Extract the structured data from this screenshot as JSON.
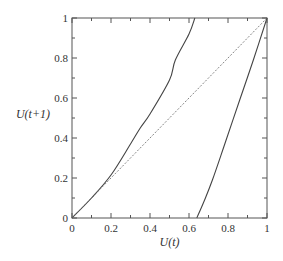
{
  "chart_data": {
    "type": "line",
    "title": "",
    "xlabel": "U(t)",
    "ylabel": "U(t+1)",
    "xlim": [
      0,
      1
    ],
    "ylim": [
      0,
      1
    ],
    "grid": false,
    "legend": null,
    "x_ticks": [
      0,
      0.2,
      0.4,
      0.6,
      0.8,
      1
    ],
    "x_tick_labels": [
      "0",
      "0.2",
      "0.4",
      "0.6",
      "0.8",
      "1"
    ],
    "y_ticks": [
      0,
      0.2,
      0.4,
      0.6,
      0.8,
      1
    ],
    "y_tick_labels": [
      "0",
      "0.2",
      "0.4",
      "0.6",
      "0.8",
      "1"
    ],
    "minor_ticks_step": 0.1,
    "series": [
      {
        "name": "map-left-branch",
        "style": "solid",
        "color": "#444444",
        "x": [
          0,
          0.1,
          0.2,
          0.3,
          0.35,
          0.4,
          0.5,
          0.53,
          0.6,
          0.63
        ],
        "y": [
          0,
          0.1,
          0.215,
          0.37,
          0.45,
          0.52,
          0.69,
          0.79,
          0.92,
          1.0
        ]
      },
      {
        "name": "map-right-branch",
        "style": "solid",
        "color": "#444444",
        "x": [
          0.64,
          0.68,
          0.72,
          0.78,
          0.86,
          0.93,
          1.0
        ],
        "y": [
          0,
          0.09,
          0.19,
          0.36,
          0.59,
          0.79,
          1.0
        ]
      },
      {
        "name": "identity-diagonal",
        "style": "dashed",
        "color": "#666666",
        "x": [
          0,
          1
        ],
        "y": [
          0,
          1
        ]
      }
    ]
  }
}
